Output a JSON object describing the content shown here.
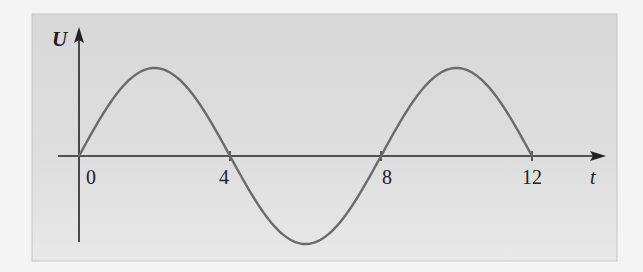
{
  "chart_data": {
    "type": "line",
    "title": "",
    "xlabel": "t",
    "ylabel": "U",
    "x_ticks": [
      0,
      4,
      8,
      12
    ],
    "x_tick_labels": [
      "0",
      "4",
      "8",
      "12"
    ],
    "xlim": [
      0,
      12
    ],
    "ylim": [
      -1,
      1
    ],
    "grid": false,
    "legend": null,
    "series": [
      {
        "name": "U(t) = sin(πt/4)",
        "function": "sin(pi*t/4)",
        "x": [
          0,
          1,
          2,
          3,
          4,
          5,
          6,
          7,
          8,
          9,
          10,
          11,
          12
        ],
        "values": [
          0,
          0.707,
          1,
          0.707,
          0,
          -0.707,
          -1,
          -0.707,
          0,
          0.707,
          1,
          0.707,
          0
        ]
      }
    ],
    "colors": {
      "panel": "#dadada",
      "curve": "#6b6b6b",
      "axis": "#222222"
    }
  }
}
